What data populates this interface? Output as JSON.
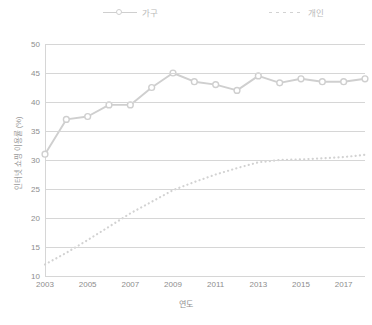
{
  "chart_data": {
    "type": "line",
    "title": "",
    "xlabel": "연도",
    "ylabel": "인터넷 쇼핑 이용률 (%)",
    "x": [
      2003,
      2004,
      2005,
      2006,
      2007,
      2008,
      2009,
      2010,
      2011,
      2012,
      2013,
      2014,
      2015,
      2016,
      2017,
      2018
    ],
    "xtick_labels": [
      "2003",
      "2005",
      "2007",
      "2009",
      "2011",
      "2013",
      "2015",
      "2017"
    ],
    "xtick_values": [
      2003,
      2005,
      2007,
      2009,
      2011,
      2013,
      2015,
      2017
    ],
    "ytick_labels": [
      "10",
      "15",
      "20",
      "25",
      "30",
      "35",
      "40",
      "45",
      "50"
    ],
    "ytick_values": [
      10,
      15,
      20,
      25,
      30,
      35,
      40,
      45,
      50
    ],
    "ylim": [
      10,
      50
    ],
    "xlim": [
      2003,
      2018
    ],
    "grid": true,
    "legend_position": "top",
    "series": [
      {
        "name": "가구",
        "style": "solid",
        "marker": "circle",
        "color": "#cfcfcf",
        "values": [
          31.0,
          37.0,
          37.5,
          39.5,
          39.5,
          42.5,
          45.0,
          43.5,
          43.0,
          42.0,
          44.5,
          43.3,
          44.0,
          43.5,
          43.5,
          44.0
        ]
      },
      {
        "name": "개인",
        "style": "dotted",
        "marker": "none",
        "color": "#d2d2d2",
        "values": [
          12.0,
          14.0,
          16.2,
          18.5,
          20.8,
          22.8,
          24.8,
          26.2,
          27.5,
          28.6,
          29.6,
          30.0,
          30.1,
          30.3,
          30.5,
          30.9
        ]
      }
    ]
  },
  "legend": {
    "items": [
      {
        "label": "가구"
      },
      {
        "label": "개인"
      }
    ]
  }
}
